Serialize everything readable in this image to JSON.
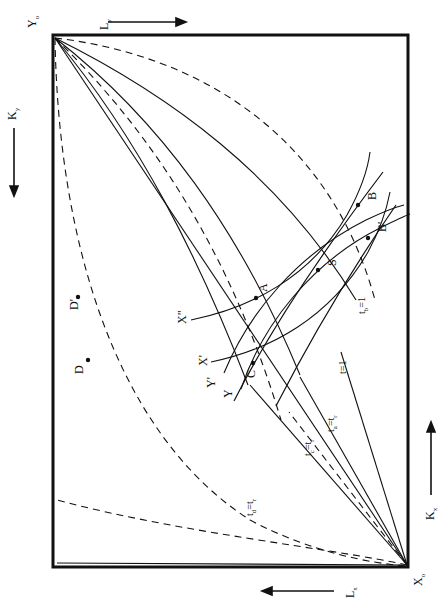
{
  "figure": {
    "kind": "rotated-edgeworth-box-diagram",
    "orientation_degrees": -90,
    "background_color": "#ffffff",
    "line_color": "#111111",
    "box": {
      "x": 53,
      "y": 35,
      "width": 355,
      "height": 532
    }
  },
  "axis_labels": {
    "origin_top_left": "Y",
    "origin_top_left_sub": "o",
    "origin_bottom_right": "X",
    "origin_bottom_right_sub": "o",
    "left_axis": "K",
    "left_axis_sub": "y",
    "right_axis": "K",
    "right_axis_sub": "x",
    "top_axis": "L",
    "top_axis_sub": "y",
    "bottom_axis": "L",
    "bottom_axis_sub": "x"
  },
  "arrows": [
    {
      "name": "arrow-Ly",
      "label": "L y",
      "direction": "right"
    },
    {
      "name": "arrow-Ky",
      "label": "K y",
      "direction": "down"
    },
    {
      "name": "arrow-Kx",
      "label": "K x",
      "direction": "up"
    },
    {
      "name": "arrow-Lx",
      "label": "L x",
      "direction": "left"
    }
  ],
  "point_labels": [
    {
      "name": "point-A",
      "text": "A",
      "x": 257,
      "y": 287
    },
    {
      "name": "point-B",
      "text": "B",
      "x": 369,
      "y": 201
    },
    {
      "name": "point-B-prime",
      "text": "B'",
      "x": 375,
      "y": 228
    },
    {
      "name": "point-C",
      "text": "C",
      "x": 243,
      "y": 372
    },
    {
      "name": "point-S",
      "text": "S",
      "x": 327,
      "y": 262
    },
    {
      "name": "point-D",
      "text": "D",
      "x": 74,
      "y": 366
    },
    {
      "name": "point-D-prime",
      "text": "D'",
      "x": 74,
      "y": 303
    }
  ],
  "curve_labels": [
    {
      "name": "curve-label-X-double-prime",
      "text": "X\"",
      "x": 178,
      "y": 318
    },
    {
      "name": "curve-label-X-prime",
      "text": "X'",
      "x": 199,
      "y": 360
    },
    {
      "name": "curve-label-Y-prime",
      "text": "Y'",
      "x": 206,
      "y": 381
    },
    {
      "name": "curve-label-Y",
      "text": "Y",
      "x": 222,
      "y": 391
    },
    {
      "name": "ray-label-t-equals-1",
      "text": "t=1",
      "x": 339,
      "y": 366
    },
    {
      "name": "ray-label-tc-equals-tr",
      "text": "t  = t",
      "x": 305,
      "y": 443
    },
    {
      "name": "ray-label-ta-equals-tr",
      "text": "t  = t",
      "x": 328,
      "y": 420
    },
    {
      "name": "ray-label-td-equals-tr",
      "text": "t  = t",
      "x": 247,
      "y": 504
    },
    {
      "name": "ray-label-tb-equals-1",
      "text": "t  = 1",
      "x": 359,
      "y": 302
    }
  ],
  "subscripts": {
    "tc": "c",
    "ta": "a",
    "td": "d",
    "tb": "b",
    "tr": "r"
  }
}
